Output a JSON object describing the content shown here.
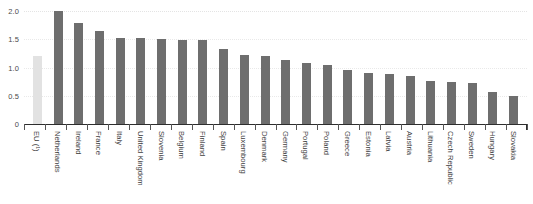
{
  "chart_data": {
    "type": "bar",
    "title": "",
    "subtitle": "",
    "xlabel": "",
    "ylabel": "",
    "ylim": [
      0,
      2.0
    ],
    "grid": true,
    "legend": "none",
    "y_ticks": [
      "0",
      "0.5",
      "1.0",
      "1.5",
      "2.0"
    ],
    "y_tick_values": [
      0,
      0.5,
      1.0,
      1.5,
      2.0
    ],
    "categories": [
      "EU (¹)",
      "Netherlands",
      "Ireland",
      "France",
      "Italy",
      "United Kingdom",
      "Slovenia",
      "Belgium",
      "Finland",
      "Spain",
      "Luxembourg",
      "Denmark",
      "Germany",
      "Portugal",
      "Poland",
      "Greece",
      "Estonia",
      "Latvia",
      "Austria",
      "Lithuania",
      "Czech Republic",
      "Sweden",
      "Hungary",
      "Slovakia"
    ],
    "values": [
      1.2,
      2.0,
      1.78,
      1.65,
      1.53,
      1.52,
      1.5,
      1.49,
      1.48,
      1.33,
      1.22,
      1.21,
      1.13,
      1.08,
      1.04,
      0.95,
      0.91,
      0.88,
      0.85,
      0.76,
      0.74,
      0.72,
      0.56,
      0.5
    ],
    "highlight_index": 0,
    "colors": {
      "bar": "#6e6e6e",
      "highlight_bar": "#e2e2e2",
      "gridline": "#e9e9e9",
      "axis": "#2e2e2e",
      "tick_label": "#3d3d3d",
      "background": "#ffffff"
    }
  }
}
